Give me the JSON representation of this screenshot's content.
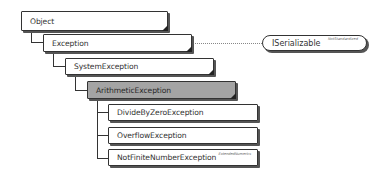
{
  "diagram": {
    "nodes": [
      {
        "id": "object",
        "label": "Object",
        "level": 0
      },
      {
        "id": "exception",
        "label": "Exception",
        "level": 1
      },
      {
        "id": "systemexception",
        "label": "SystemException",
        "level": 2
      },
      {
        "id": "arithmeticexception",
        "label": "ArithmeticException",
        "level": 3,
        "highlighted": true
      },
      {
        "id": "dividebyzeroexception",
        "label": "DivideByZeroException",
        "level": 4
      },
      {
        "id": "overflowexception",
        "label": "OverflowException",
        "level": 4
      },
      {
        "id": "notfinitenumberexception",
        "label": "NotFiniteNumberException",
        "level": 4,
        "tag": "ExtendedNumerics"
      }
    ],
    "interface": {
      "label": "ISerializable",
      "tag": "NotStandardized",
      "implemented_by": "exception"
    },
    "colors": {
      "highlight_fill": "#a4a4a4",
      "border": "#333333",
      "background": "#ffffff"
    }
  }
}
